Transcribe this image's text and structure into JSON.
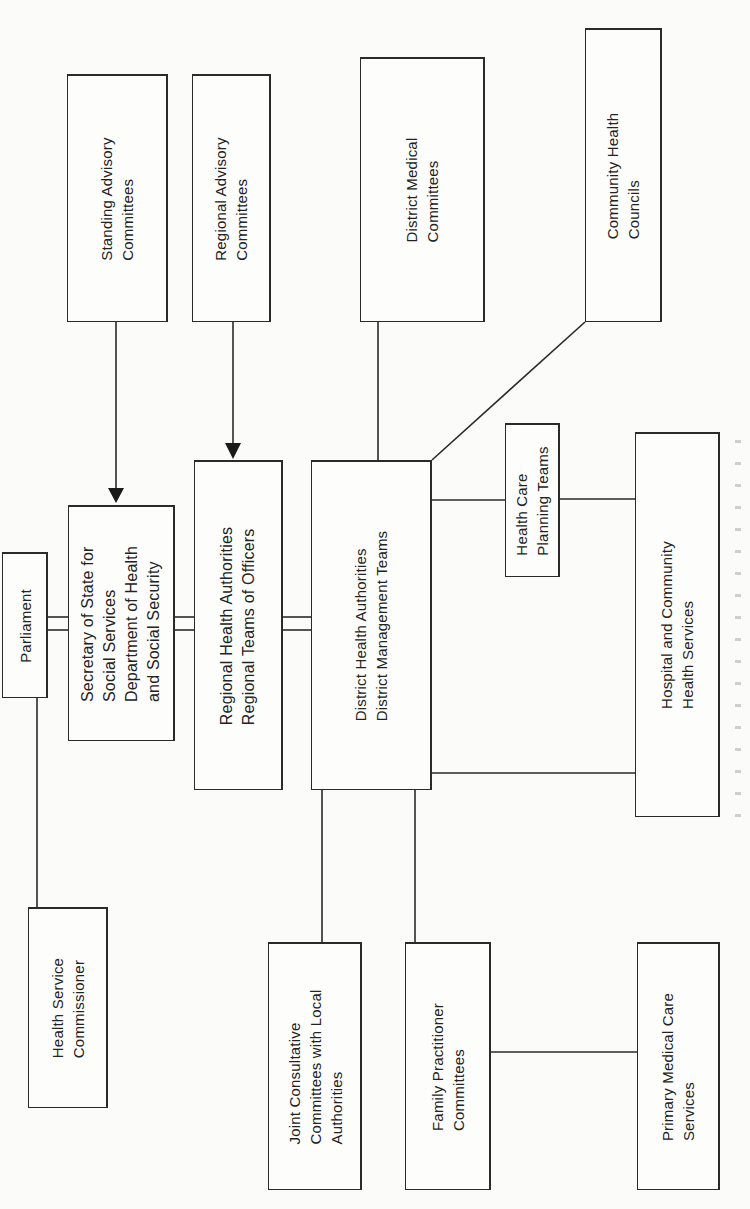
{
  "diagram": {
    "orientation": "rotated-90-ccw",
    "nodes": {
      "standing_advisory": {
        "lines": [
          "Standing Advisory",
          "Committees"
        ]
      },
      "regional_advisory": {
        "lines": [
          "Regional Advisory",
          "Committees"
        ]
      },
      "district_medical": {
        "lines": [
          "District Medical",
          "Committees"
        ]
      },
      "community_health_councils": {
        "lines": [
          "Community Health",
          "Councils"
        ]
      },
      "parliament": {
        "lines": [
          "Parliament"
        ]
      },
      "secretary_of_state": {
        "lines": [
          "Secretary of State for",
          "Social Services",
          "Department of Health",
          "and Social Security"
        ]
      },
      "regional_health_authorities": {
        "lines": [
          "Regional Health Authorities",
          "Regional Teams of Officers"
        ]
      },
      "district_health_authorities": {
        "lines": [
          "District Health Authorities",
          "District Management Teams"
        ]
      },
      "health_care_planning_teams": {
        "lines": [
          "Health Care",
          "Planning Teams"
        ]
      },
      "hospital_community_services": {
        "lines": [
          "Hospital and Community",
          "Health Services"
        ]
      },
      "health_service_commissioner": {
        "lines": [
          "Health Service",
          "Commissioner"
        ]
      },
      "joint_consultative": {
        "lines": [
          "Joint Consultative",
          "Committees with Local",
          "Authorities"
        ]
      },
      "family_practitioner": {
        "lines": [
          "Family Practitioner",
          "Committees"
        ]
      },
      "primary_medical_care": {
        "lines": [
          "Primary Medical Care",
          "Services"
        ]
      }
    },
    "edges": [
      {
        "from": "standing_advisory",
        "to": "secretary_of_state",
        "type": "arrow"
      },
      {
        "from": "regional_advisory",
        "to": "regional_health_authorities",
        "type": "arrow"
      },
      {
        "from": "parliament",
        "to": "secretary_of_state",
        "type": "double-line"
      },
      {
        "from": "secretary_of_state",
        "to": "regional_health_authorities",
        "type": "double-line"
      },
      {
        "from": "regional_health_authorities",
        "to": "district_health_authorities",
        "type": "double-line"
      },
      {
        "from": "parliament",
        "to": "health_service_commissioner",
        "type": "line"
      },
      {
        "from": "district_medical",
        "to": "district_health_authorities",
        "type": "line"
      },
      {
        "from": "community_health_councils",
        "to": "district_health_authorities",
        "type": "diagonal-line"
      },
      {
        "from": "district_health_authorities",
        "to": "health_care_planning_teams",
        "type": "line"
      },
      {
        "from": "health_care_planning_teams",
        "to": "hospital_community_services",
        "type": "line"
      },
      {
        "from": "district_health_authorities",
        "to": "hospital_community_services",
        "type": "line"
      },
      {
        "from": "district_health_authorities",
        "to": "joint_consultative",
        "type": "line"
      },
      {
        "from": "district_health_authorities",
        "to": "family_practitioner",
        "type": "line"
      },
      {
        "from": "family_practitioner",
        "to": "primary_medical_care",
        "type": "line"
      }
    ],
    "colors": {
      "ink": "#2a2a2a",
      "paper": "#fbfbf9"
    }
  }
}
